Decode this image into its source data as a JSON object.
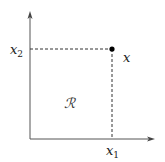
{
  "diagram": {
    "type": "coordinate-plane",
    "colors": {
      "axis": "#555555",
      "dashed": "#333333",
      "point": "#000000",
      "text": "#222222"
    },
    "axes": {
      "x_axis": {
        "label": "x",
        "subscript": "1"
      },
      "y_axis": {
        "label": "x",
        "subscript": "2"
      }
    },
    "point": {
      "label": "x"
    },
    "region": {
      "label": "ℛ"
    }
  }
}
